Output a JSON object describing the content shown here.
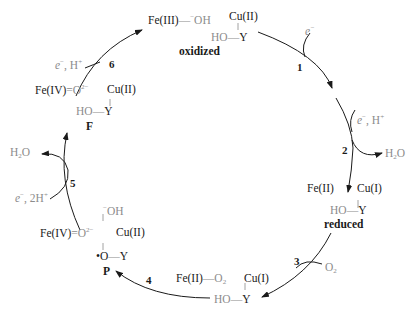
{
  "colors": {
    "ink": "#1a1a1a",
    "muted": "#8c8c8c",
    "background": "#ffffff"
  },
  "states": {
    "oxidized": {
      "fe": "Fe(III)",
      "fe_ligand": "OH",
      "fe_ligand_charge": "−",
      "cu": "Cu(II)",
      "tyr": "HO",
      "y": "Y",
      "name": "oxidized"
    },
    "reduced": {
      "fe": "Fe(II)",
      "cu": "Cu(I)",
      "tyr": "HO",
      "y": "Y",
      "name": "reduced"
    },
    "oxy": {
      "fe": "Fe(II)",
      "fe_ligand": "O",
      "fe_ligand_sub": "2",
      "cu": "Cu(I)",
      "tyr": "HO",
      "y": "Y"
    },
    "P": {
      "fe": "Fe(IV)",
      "oxo": "O",
      "oxo_charge": "2−",
      "cu": "Cu(II)",
      "cu_ligand": "OH",
      "cu_ligand_charge": "−",
      "tyr": "•O",
      "y": "Y",
      "name": "P"
    },
    "F": {
      "fe": "Fe(IV)",
      "oxo": "O",
      "oxo_charge": "2−",
      "cu": "Cu(II)",
      "tyr": "HO",
      "y": "Y",
      "name": "F"
    }
  },
  "steps": [
    {
      "num": "1",
      "input": "e",
      "input_charge": "−"
    },
    {
      "num": "2",
      "input": "e",
      "input_charge": "−",
      "input_extra": ", H",
      "input_extra_charge": "+",
      "output": "H",
      "output_sub": "2",
      "output_tail": "O"
    },
    {
      "num": "3",
      "input": "O",
      "input_sub": "2"
    },
    {
      "num": "4"
    },
    {
      "num": "5",
      "input": "e",
      "input_charge": "−",
      "input_extra": ", 2H",
      "input_extra_charge": "+",
      "output": "H",
      "output_sub": "2",
      "output_tail": "O"
    },
    {
      "num": "6",
      "input": "e",
      "input_charge": "−",
      "input_extra": ", H",
      "input_extra_charge": "+"
    }
  ]
}
